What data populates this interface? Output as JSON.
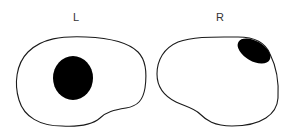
{
  "diagram": {
    "panels": [
      {
        "id": "left",
        "label": "L",
        "lesion": {
          "shape": "ellipse",
          "position": "center",
          "fill": "#000000"
        },
        "outline_color": "#1a1a1a"
      },
      {
        "id": "right",
        "label": "R",
        "lesion": {
          "shape": "ellipse",
          "position": "upper-right",
          "fill": "#000000"
        },
        "outline_color": "#1a1a1a"
      }
    ],
    "background": "#ffffff"
  }
}
